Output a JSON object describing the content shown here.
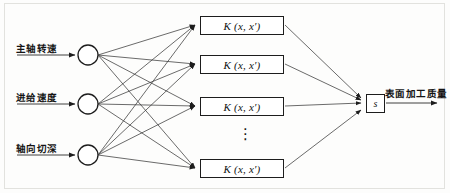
{
  "diagram": {
    "inputs": [
      {
        "label": "主轴转速",
        "node_name": "input-node-1"
      },
      {
        "label": "进给速度",
        "node_name": "input-node-2"
      },
      {
        "label": "轴向切深",
        "node_name": "input-node-3"
      }
    ],
    "kernels": [
      {
        "label": "K (x, x′)"
      },
      {
        "label": "K (x, x′)"
      },
      {
        "label": "K (x, x′)"
      },
      {
        "label": "K (x, x′)"
      }
    ],
    "ellipsis": "⋮",
    "sum_node": {
      "label": "s"
    },
    "output": {
      "label": "表面加工质量"
    },
    "colors": {
      "stroke": "#1d1d1d",
      "wire": "#3a3a3a",
      "background": "#fdfdfc",
      "border": "#e2e2de"
    }
  }
}
